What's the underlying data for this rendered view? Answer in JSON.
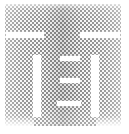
{
  "image": {
    "kind": "logo-mark",
    "alt_text": "IEI",
    "width": 129,
    "height": 134,
    "background_color": "#ffffff",
    "ink_color": "#8e8e8e",
    "render_style": "halftone-dither-checkerboard",
    "halftone_cell_px": 2
  },
  "mark": {
    "name": "iei-monogram",
    "description": "Square dithered gray block carved by white negative space into an IEI monogram",
    "strokes": [
      {
        "id": "top-gap-left",
        "role": "crossbar-gap",
        "x": 6,
        "y": 32,
        "w": 38,
        "h": 6
      },
      {
        "id": "top-gap-right",
        "role": "crossbar-gap",
        "x": 80,
        "y": 32,
        "w": 40,
        "h": 6
      },
      {
        "id": "slot-left",
        "role": "counter",
        "x": 33,
        "y": 55,
        "w": 8,
        "h": 62
      },
      {
        "id": "slot-right",
        "role": "counter",
        "x": 91,
        "y": 55,
        "w": 8,
        "h": 62
      },
      {
        "id": "e-bar-top",
        "role": "letter-bar",
        "x": 60,
        "y": 56,
        "w": 20,
        "h": 5
      },
      {
        "id": "e-bar-middle",
        "role": "letter-bar",
        "x": 60,
        "y": 78,
        "w": 20,
        "h": 5
      },
      {
        "id": "e-bar-bottom",
        "role": "letter-bar",
        "x": 57,
        "y": 101,
        "w": 24,
        "h": 5
      }
    ]
  }
}
